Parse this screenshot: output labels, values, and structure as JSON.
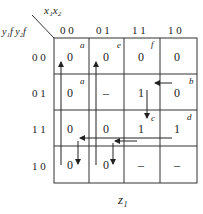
{
  "header": {
    "col_var": "x₁x₂",
    "row_var": "y₁f y₂f",
    "columns": [
      "0 0",
      "0 1",
      "1 1",
      "1 0"
    ],
    "rows": [
      "0 0",
      "0 1",
      "1 1",
      "1 0"
    ]
  },
  "cells": [
    [
      "0",
      "0",
      "0",
      "0"
    ],
    [
      "0",
      "–",
      "1",
      "0"
    ],
    [
      "0",
      "0",
      "1",
      "1"
    ],
    [
      "0",
      "0",
      "–",
      "–"
    ]
  ],
  "state_labels": {
    "a1": "a",
    "e": "e",
    "f": "f",
    "a2": "a",
    "b": "b",
    "c": "c",
    "d": "d"
  },
  "output_label": "z₁"
}
